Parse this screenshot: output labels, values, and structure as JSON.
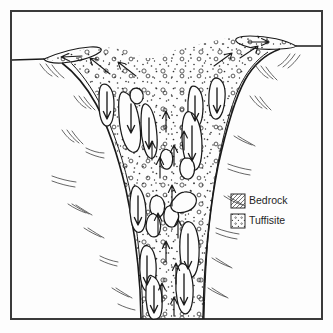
{
  "figure": {
    "frame": {
      "x": 11,
      "y": 11,
      "width": 311,
      "height": 308,
      "stroke": "#3a3a3a",
      "stroke_width": 2
    },
    "background_color": "#fdfdfd",
    "ink_color": "#1a1a1a"
  },
  "legend": {
    "position": "middle-right",
    "items": [
      {
        "key": "bedrock",
        "label": "Bedrock",
        "swatch": "hatch-lines",
        "swatch_x": 231,
        "swatch_y": 194
      },
      {
        "key": "tuffisite",
        "label": "Tuffisite",
        "swatch": "dots",
        "swatch_x": 231,
        "swatch_y": 214
      }
    ],
    "label_x": 249,
    "swatch_size": 14,
    "swatch_stroke": "#2b2b2b"
  },
  "units": {
    "bedrock": {
      "name": "Bedrock",
      "hatch_color": "#4a4a4a",
      "description": "Country rock flanking and below the vent, drawn with sparse curved hatch strokes"
    },
    "tuffisite": {
      "name": "Tuffisite",
      "dot_color": "#333333",
      "description": "Dotted fragmental matrix filling the vent and forming surface lips"
    }
  },
  "ground_surface": {
    "left_level_y": 60,
    "right_level_y": 46,
    "left_lip": "raised tuffisite deposit at left vent margin",
    "right_lip": "raised tuffisite deposit at right vent margin"
  },
  "vent": {
    "shape": "funnel narrowing downward, truncated at base of frame",
    "top_left_x": 88,
    "top_right_x": 240,
    "bottom_left_x": 140,
    "bottom_right_x": 200,
    "bottom_y": 319
  },
  "flow_arrows": {
    "center_direction": "up",
    "margin_direction": "down",
    "description": "Upward arrows along the vent axis, downward arrows on blocks at vent margins"
  },
  "bedrock_blocks": {
    "count": 18,
    "description": "Elongate stoped bedrock blocks suspended in tuffisite, each carrying a downward arrow"
  }
}
